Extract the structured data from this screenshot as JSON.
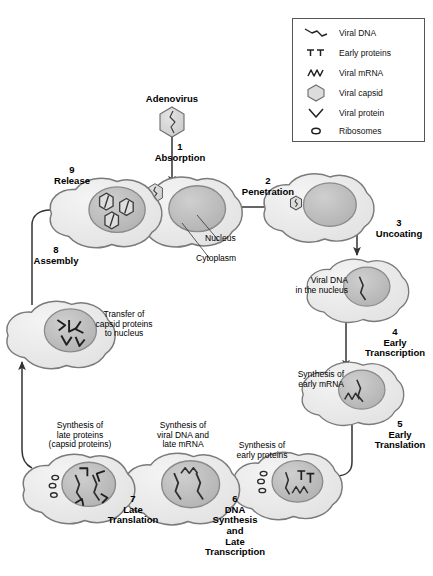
{
  "legend": {
    "items": [
      {
        "icon": "viral-dna-icon",
        "label": "Viral DNA"
      },
      {
        "icon": "early-proteins-icon",
        "label": "Early proteins"
      },
      {
        "icon": "viral-mrna-icon",
        "label": "Viral mRNA"
      },
      {
        "icon": "viral-capsid-icon",
        "label": "Viral capsid"
      },
      {
        "icon": "viral-protein-icon",
        "label": "Viral protein"
      },
      {
        "icon": "ribosomes-icon",
        "label": "Ribosomes"
      }
    ]
  },
  "diagram": {
    "virus_label": "Adenovirus",
    "annotations": [
      {
        "name": "nucleus",
        "label": "Nucleus"
      },
      {
        "name": "cytoplasm",
        "label": "Cytoplasm"
      }
    ],
    "steps": [
      {
        "number": "1",
        "name": "Absorption",
        "label": "1\nAbsorption"
      },
      {
        "number": "2",
        "name": "Penetration",
        "label": "2\nPenetration"
      },
      {
        "number": "3",
        "name": "Uncoating",
        "label": "3\nUncoating"
      },
      {
        "number": "4",
        "name": "Early Transcription",
        "label": "4\nEarly\nTranscription"
      },
      {
        "number": "5",
        "name": "Early Translation",
        "label": "5\nEarly\nTranslation"
      },
      {
        "number": "6",
        "name": "DNA Synthesis and Late Transcription",
        "label": "6\nDNA\nSynthesis\nand\nLate\nTranscription"
      },
      {
        "number": "7",
        "name": "Late Translation",
        "label": "7\nLate\nTranslation"
      },
      {
        "number": "8",
        "name": "Assembly",
        "label": "8\nAssembly"
      },
      {
        "number": "9",
        "name": "Release",
        "label": "9\nRelease"
      }
    ],
    "state_labels": [
      {
        "name": "viral-dna-in-nucleus",
        "label": "Viral DNA\nin the nucleus"
      },
      {
        "name": "synthesis-early-mrna",
        "label": "Synthesis of\nearly mRNA"
      },
      {
        "name": "synthesis-early-proteins",
        "label": "Synthesis of\nearly proteins"
      },
      {
        "name": "synthesis-viral-dna-late-mrna",
        "label": "Synthesis of\nviral DNA and\nlate mRNA"
      },
      {
        "name": "synthesis-late-proteins",
        "label": "Synthesis of\nlate proteins\n(capsid proteins)"
      },
      {
        "name": "transfer-capsid-proteins",
        "label": "Transfer of\ncapsid proteins\nto nucleus"
      }
    ]
  },
  "colors": {
    "cytoplasm_fill": "#ededed",
    "nucleus_fill": "#bdbdbd",
    "capsid_fill": "#d6d6d6",
    "outline": "#6b6b6b",
    "arrow": "#333333",
    "legend_border": "#555555"
  }
}
